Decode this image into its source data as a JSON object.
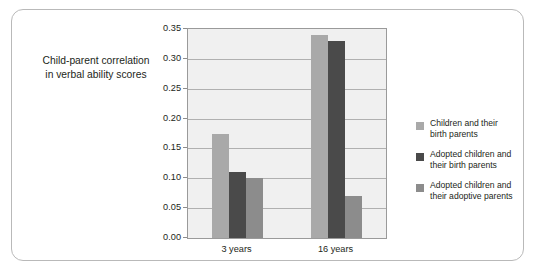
{
  "axis_title": {
    "line1": "Child-parent correlation",
    "line2": "in verbal ability scores"
  },
  "legend": {
    "items": [
      {
        "label_line1": "Children and their",
        "label_line2": "birth parents",
        "color": "#a9a9a9"
      },
      {
        "label_line1": "Adopted children and",
        "label_line2": "their birth parents",
        "color": "#4a4a4a"
      },
      {
        "label_line1": "Adopted children and",
        "label_line2": "their adoptive parents",
        "color": "#8c8c8c"
      }
    ]
  },
  "chart_data": {
    "type": "bar",
    "title": "",
    "xlabel": "",
    "ylabel": "Child-parent correlation in verbal ability scores",
    "categories": [
      "3 years",
      "16 years"
    ],
    "series": [
      {
        "name": "Children and their birth parents",
        "color": "#a9a9a9",
        "values": [
          0.175,
          0.34
        ]
      },
      {
        "name": "Adopted children and their birth parents",
        "color": "#4a4a4a",
        "values": [
          0.11,
          0.33
        ]
      },
      {
        "name": "Adopted children and their adoptive parents",
        "color": "#8c8c8c",
        "values": [
          0.1,
          0.07
        ]
      }
    ],
    "ylim": [
      0.0,
      0.35
    ],
    "ytick_values": [
      0.0,
      0.05,
      0.1,
      0.15,
      0.2,
      0.25,
      0.3,
      0.35
    ],
    "ytick_labels": [
      "0.00",
      "0.05",
      "0.10",
      "0.15",
      "0.20",
      "0.25",
      "0.30",
      "0.35"
    ],
    "grid": true,
    "legend_position": "right"
  }
}
